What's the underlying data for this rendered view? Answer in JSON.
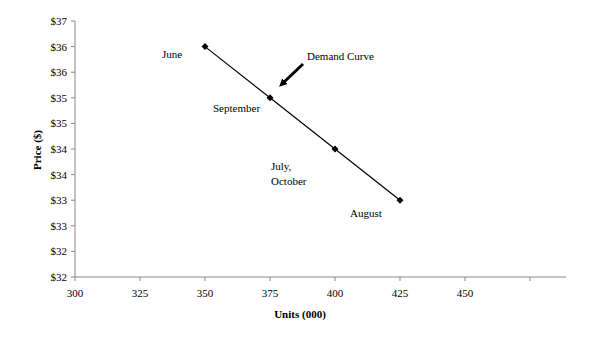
{
  "chart_data": {
    "type": "line",
    "title": "",
    "xlabel": "Units (000)",
    "ylabel": "Price ($)",
    "xlim": [
      300,
      480
    ],
    "ylim": [
      32,
      37
    ],
    "x_ticks": [
      300,
      325,
      350,
      375,
      400,
      425,
      450,
      475
    ],
    "x_tick_labels": [
      "300",
      "325",
      "350",
      "375",
      "400",
      "425",
      "450",
      ""
    ],
    "y_ticks": [
      37,
      36.5,
      36,
      35.5,
      35,
      34.5,
      34,
      33.5,
      33,
      32.5,
      32
    ],
    "y_tick_labels": [
      "$37",
      "$36",
      "$36",
      "$35",
      "$35",
      "$34",
      "$34",
      "$33",
      "$33",
      "$32",
      "$32"
    ],
    "grid": false,
    "legend": null,
    "series": [
      {
        "name": "Demand Curve",
        "x": [
          350,
          375,
          400,
          425
        ],
        "y": [
          36.5,
          35.5,
          34.5,
          33.5
        ],
        "marker": "diamond",
        "color": "#000000"
      }
    ],
    "annotations": [
      {
        "text": "June",
        "x": 350,
        "y": 36.5
      },
      {
        "text": "September",
        "x": 375,
        "y": 35.5
      },
      {
        "text": "July,",
        "x": 400,
        "y": 34.5
      },
      {
        "text": "October",
        "x": 400,
        "y": 34.5
      },
      {
        "text": "August",
        "x": 425,
        "y": 33.5
      },
      {
        "text": "Demand Curve",
        "arrow": true
      }
    ]
  },
  "labels": {
    "june": "June",
    "september": "September",
    "july": "July,",
    "october": "October",
    "august": "August",
    "demand_curve": "Demand Curve"
  }
}
